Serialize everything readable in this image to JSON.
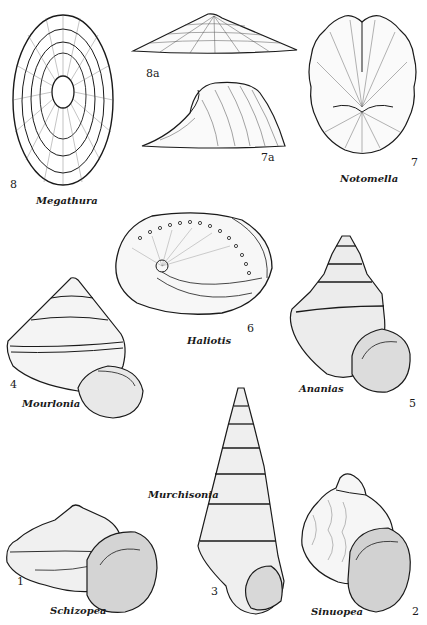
{
  "plate": {
    "background": "#ffffff",
    "ink": "#1a1a1a",
    "figures": [
      {
        "id": "8",
        "genus": "Megathura",
        "number": "8",
        "view": "top"
      },
      {
        "id": "8a",
        "genus": "Megathura",
        "number": "8a",
        "view": "side"
      },
      {
        "id": "7a",
        "genus": "Notomella",
        "number": "7a",
        "view": "side"
      },
      {
        "id": "7",
        "genus": "Notomella",
        "number": "7",
        "view": "top"
      },
      {
        "id": "6",
        "genus": "Haliotis",
        "number": "6"
      },
      {
        "id": "4",
        "genus": "Mourlonia",
        "number": "4"
      },
      {
        "id": "5",
        "genus": "Ananias",
        "number": "5"
      },
      {
        "id": "3",
        "genus": "Murchisonia",
        "number": "3"
      },
      {
        "id": "1",
        "genus": "Schizopea",
        "number": "1"
      },
      {
        "id": "2",
        "genus": "Sinuopea",
        "number": "2"
      }
    ]
  },
  "labels": {
    "megathura": "Megathura",
    "notomella": "Notomella",
    "haliotis": "Haliotis",
    "mourlonia": "Mourlonia",
    "ananias": "Ananias",
    "murchisonia": "Murchisonia",
    "schizopea": "Schizopea",
    "sinuopea": "Sinuopea"
  },
  "numbers": {
    "n8": "8",
    "n8a": "8a",
    "n7a": "7a",
    "n7": "7",
    "n6": "6",
    "n4": "4",
    "n5": "5",
    "n3": "3",
    "n1": "1",
    "n2": "2"
  }
}
